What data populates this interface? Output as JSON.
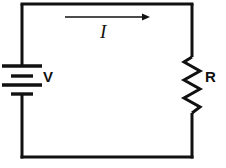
{
  "figure": {
    "type": "circuit-diagram",
    "background_color": "#ffffff",
    "line_color": "#111111",
    "line_width": 3
  },
  "labels": {
    "voltage": "V",
    "current": "I",
    "resistance": "R"
  },
  "components": {
    "battery": {
      "name": "battery",
      "label": "V",
      "position": "left-branch",
      "plate_count": 4,
      "plate_pattern": [
        "long",
        "short",
        "long",
        "short"
      ],
      "plate_y": [
        66,
        76,
        85,
        94
      ],
      "long_plate_width": 40,
      "short_plate_width": 22,
      "center_x": 22
    },
    "resistor": {
      "name": "resistor",
      "label": "R",
      "position": "right-branch",
      "style": "zigzag",
      "zigzag_peaks": 6,
      "top_y": 57,
      "bottom_y": 113,
      "center_x": 192,
      "amplitude": 8
    },
    "current_arrow": {
      "name": "current-arrow",
      "label": "I",
      "direction": "right",
      "position": "top-branch",
      "x_start": 65,
      "x_end": 150,
      "y": 17
    }
  },
  "wires": {
    "loop_left_x": 22,
    "loop_right_x": 192,
    "loop_top_y": 4,
    "loop_bottom_y": 157,
    "segments": [
      {
        "name": "top-wire",
        "from": [
          22,
          4
        ],
        "to": [
          192,
          4
        ]
      },
      {
        "name": "right-wire-upper",
        "from": [
          192,
          4
        ],
        "to": [
          192,
          57
        ]
      },
      {
        "name": "right-wire-lower",
        "from": [
          192,
          113
        ],
        "to": [
          192,
          157
        ]
      },
      {
        "name": "bottom-wire",
        "from": [
          192,
          157
        ],
        "to": [
          22,
          157
        ]
      },
      {
        "name": "left-wire-lower",
        "from": [
          22,
          157
        ],
        "to": [
          22,
          94
        ]
      },
      {
        "name": "left-wire-upper",
        "from": [
          22,
          66
        ],
        "to": [
          22,
          4
        ]
      }
    ]
  }
}
